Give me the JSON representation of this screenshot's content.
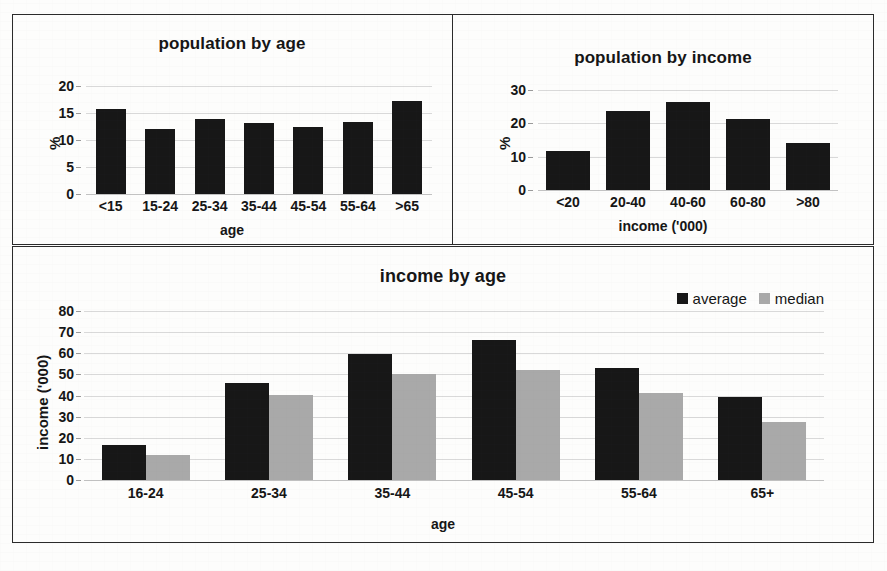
{
  "page": {
    "background": "#fdfdfc",
    "frame_color": "#2b2b2b"
  },
  "colors": {
    "series_average": "#171717",
    "series_median": "#a9a9a9",
    "gridline": "#d9d9d9",
    "text": "#161616"
  },
  "chart_data": [
    {
      "id": "population-by-age",
      "type": "bar",
      "title": "population by age",
      "xlabel": "age",
      "ylabel": "%",
      "categories": [
        "<15",
        "15-24",
        "25-34",
        "35-44",
        "45-54",
        "55-64",
        ">65"
      ],
      "values": [
        15.8,
        12.0,
        13.8,
        13.1,
        12.4,
        13.4,
        17.3
      ],
      "yticks": [
        20,
        15,
        10,
        5,
        0
      ],
      "ylim": [
        0,
        20
      ],
      "grid": true,
      "legend": null,
      "series_color": "#171717"
    },
    {
      "id": "population-by-income",
      "type": "bar",
      "title": "population by income",
      "xlabel": "income ('000)",
      "ylabel": "%",
      "categories": [
        "<20",
        "20-40",
        "40-60",
        "60-80",
        ">80"
      ],
      "values": [
        11.7,
        23.8,
        26.4,
        21.3,
        14.0
      ],
      "yticks": [
        30,
        20,
        10,
        0
      ],
      "ylim": [
        0,
        30
      ],
      "grid": true,
      "legend": null,
      "series_color": "#171717"
    },
    {
      "id": "income-by-age",
      "type": "bar",
      "title": "income by age",
      "xlabel": "age",
      "ylabel": "income ('000)",
      "categories": [
        "16-24",
        "25-34",
        "35-44",
        "45-54",
        "55-64",
        "65+"
      ],
      "series": [
        {
          "name": "average",
          "color": "#171717",
          "values": [
            16.5,
            46.0,
            59.5,
            66.5,
            53.0,
            39.5
          ]
        },
        {
          "name": "median",
          "color": "#a9a9a9",
          "values": [
            11.8,
            40.3,
            50.0,
            52.0,
            41.0,
            27.5
          ]
        }
      ],
      "yticks": [
        80,
        70,
        60,
        50,
        40,
        30,
        20,
        10,
        0
      ],
      "ylim": [
        0,
        80
      ],
      "grid": true,
      "legend": {
        "position": "top-right",
        "entries": [
          "average",
          "median"
        ]
      }
    }
  ]
}
